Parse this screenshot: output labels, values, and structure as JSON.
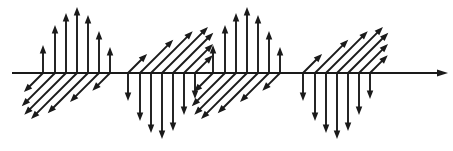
{
  "figure": {
    "title": "",
    "background_color": "#ffffff",
    "stroke_color": "#1a1a1a",
    "width": 453,
    "height": 151
  },
  "axis": {
    "name": "horizontal-axis",
    "label": "",
    "x_start": 12,
    "x_end": 448,
    "y": 73,
    "stroke_width": 2.2,
    "arrowhead": "right",
    "arrowhead_length": 11,
    "arrowhead_width": 7
  },
  "chart_data": {
    "type": "scatter",
    "title": "",
    "xlabel": "",
    "ylabel": "",
    "grid": false,
    "legend": "none",
    "xlim": [
      12,
      448
    ],
    "ylim": [
      -78,
      78
    ],
    "baseline_y": 73,
    "groups": [
      {
        "name": "group-1",
        "index": 1,
        "vertical_direction": "up",
        "diagonal_direction": "down-left",
        "vertical_arrows": [
          {
            "x": 43,
            "length": 28
          },
          {
            "x": 55,
            "length": 48
          },
          {
            "x": 66,
            "length": 60
          },
          {
            "x": 77,
            "length": 66
          },
          {
            "x": 88,
            "length": 58
          },
          {
            "x": 99,
            "length": 42
          },
          {
            "x": 110,
            "length": 26
          }
        ],
        "diagonal_arrows": [
          {
            "x": 43,
            "length": 27
          },
          {
            "x": 55,
            "length": 47
          },
          {
            "x": 66,
            "length": 59
          },
          {
            "x": 77,
            "length": 65
          },
          {
            "x": 88,
            "length": 57
          },
          {
            "x": 99,
            "length": 41
          },
          {
            "x": 110,
            "length": 25
          }
        ]
      },
      {
        "name": "group-2",
        "index": 2,
        "vertical_direction": "down",
        "diagonal_direction": "up-right",
        "vertical_arrows": [
          {
            "x": 128,
            "length": 28
          },
          {
            "x": 140,
            "length": 48
          },
          {
            "x": 151,
            "length": 60
          },
          {
            "x": 162,
            "length": 66
          },
          {
            "x": 173,
            "length": 58
          },
          {
            "x": 184,
            "length": 42
          },
          {
            "x": 195,
            "length": 26
          }
        ],
        "diagonal_arrows": [
          {
            "x": 128,
            "length": 27
          },
          {
            "x": 140,
            "length": 47
          },
          {
            "x": 151,
            "length": 59
          },
          {
            "x": 162,
            "length": 65
          },
          {
            "x": 173,
            "length": 57
          },
          {
            "x": 184,
            "length": 41
          },
          {
            "x": 195,
            "length": 25
          }
        ]
      },
      {
        "name": "group-3",
        "index": 3,
        "vertical_direction": "up",
        "diagonal_direction": "down-left",
        "vertical_arrows": [
          {
            "x": 213,
            "length": 28
          },
          {
            "x": 225,
            "length": 48
          },
          {
            "x": 236,
            "length": 60
          },
          {
            "x": 247,
            "length": 66
          },
          {
            "x": 258,
            "length": 58
          },
          {
            "x": 269,
            "length": 42
          },
          {
            "x": 280,
            "length": 26
          }
        ],
        "diagonal_arrows": [
          {
            "x": 213,
            "length": 27
          },
          {
            "x": 225,
            "length": 47
          },
          {
            "x": 236,
            "length": 59
          },
          {
            "x": 247,
            "length": 65
          },
          {
            "x": 258,
            "length": 57
          },
          {
            "x": 269,
            "length": 41
          },
          {
            "x": 280,
            "length": 25
          }
        ]
      },
      {
        "name": "group-4",
        "index": 4,
        "vertical_direction": "down",
        "diagonal_direction": "up-right",
        "vertical_arrows": [
          {
            "x": 303,
            "length": 28
          },
          {
            "x": 315,
            "length": 48
          },
          {
            "x": 326,
            "length": 60
          },
          {
            "x": 337,
            "length": 66
          },
          {
            "x": 348,
            "length": 58
          },
          {
            "x": 359,
            "length": 42
          },
          {
            "x": 370,
            "length": 26
          }
        ],
        "diagonal_arrows": [
          {
            "x": 303,
            "length": 27
          },
          {
            "x": 315,
            "length": 47
          },
          {
            "x": 326,
            "length": 59
          },
          {
            "x": 337,
            "length": 65
          },
          {
            "x": 348,
            "length": 57
          },
          {
            "x": 359,
            "length": 41
          },
          {
            "x": 370,
            "length": 25
          }
        ]
      }
    ]
  }
}
